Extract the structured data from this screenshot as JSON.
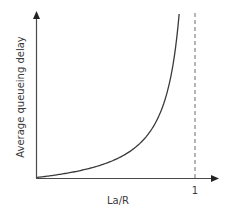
{
  "chart_data": {
    "type": "line",
    "title": "",
    "xlabel": "La/R",
    "ylabel": "Average queueing delay",
    "x_ticks": [
      {
        "value": 1,
        "label": "1"
      }
    ],
    "y_ticks": [],
    "xlim": [
      0,
      1.15
    ],
    "ylim": [
      0,
      10
    ],
    "grid": false,
    "legend": null,
    "series": [
      {
        "name": "Average queueing delay",
        "style": "solid",
        "color": "#3a3a3a",
        "x": [
          0.0,
          0.1,
          0.2,
          0.3,
          0.4,
          0.5,
          0.6,
          0.7,
          0.8,
          0.85,
          0.88,
          0.9
        ],
        "y": [
          0.0,
          0.11,
          0.25,
          0.43,
          0.67,
          1.0,
          1.5,
          2.33,
          4.0,
          5.67,
          7.33,
          9.0
        ],
        "description": "Delay grows without bound as La/R approaches 1"
      }
    ],
    "annotations": [
      {
        "type": "vertical-dashed-line",
        "x": 1,
        "label": "1",
        "description": "Asymptote at La/R = 1"
      }
    ]
  },
  "axes": {
    "x_label": "La/R",
    "y_label": "Average queueing delay",
    "x_tick_one": "1"
  },
  "colors": {
    "axis": "#4a4a4a",
    "curve": "#3a3a3a",
    "dashed": "#6a6a6a",
    "text": "#3a3a3a"
  }
}
